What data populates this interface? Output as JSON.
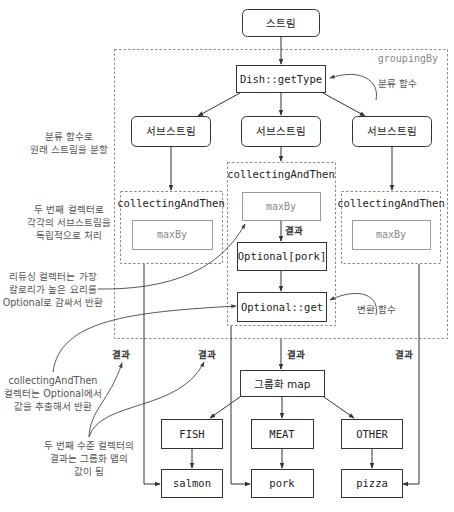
{
  "diagram": {
    "stream": "스트림",
    "grouping_label": "groupingBy",
    "classifier": "Dish::getType",
    "classifier_note": "분류 함수",
    "substreams": [
      "서브스트림",
      "서브스트림",
      "서브스트림"
    ],
    "collecting_label": "collectingAndThen",
    "maxby": "maxBy",
    "result_label": "결과",
    "optional_pork": "Optional[pork]",
    "optional_get": "Optional::get",
    "transform_note": "변환 함수",
    "group_map": "그룹화 map",
    "keys": [
      "FISH",
      "MEAT",
      "OTHER"
    ],
    "values": [
      "salmon",
      "pork",
      "pizza"
    ]
  },
  "annotations": {
    "split": [
      "분류 함수로",
      "원래 스트림을 분할"
    ],
    "second_collector": [
      "두 번째 컬렉터로",
      "각각의 서브스트림을",
      "독립적으로 처리"
    ],
    "reducing": [
      "리듀싱 컬렉터는 가장",
      "칼로리가 높은 요리를",
      "Optional로 감싸서 반환"
    ],
    "collecting_then": [
      "collectingAndThen",
      "컬렉터는 Optional에서",
      "값을 추출해서 반환"
    ],
    "map_values": [
      "두 번째 수준 컬렉터의",
      "결과는 그룹화 맵의",
      "값이 됨"
    ]
  }
}
